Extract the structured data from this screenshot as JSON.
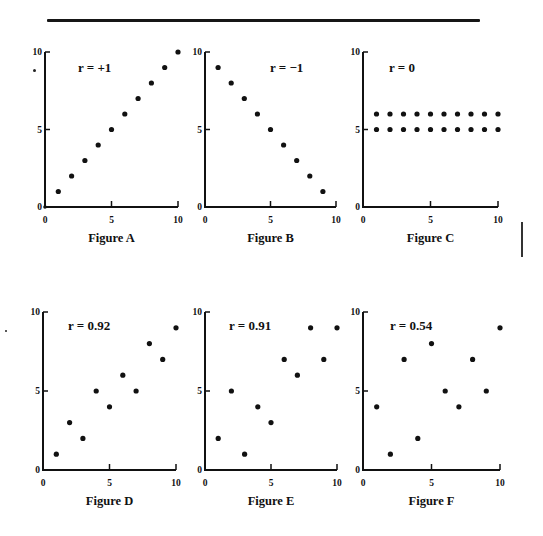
{
  "chart_data": [
    {
      "type": "scatter",
      "id": "A",
      "title": "Figure A",
      "annotation": "r = +1",
      "xlim": [
        0,
        10
      ],
      "ylim": [
        0,
        10
      ],
      "xticks": [
        0,
        5,
        10
      ],
      "yticks": [
        0,
        5,
        10
      ],
      "points": [
        [
          0,
          0
        ],
        [
          1,
          1
        ],
        [
          2,
          2
        ],
        [
          3,
          3
        ],
        [
          4,
          4
        ],
        [
          5,
          5
        ],
        [
          6,
          6
        ],
        [
          7,
          7
        ],
        [
          8,
          8
        ],
        [
          9,
          9
        ],
        [
          10,
          10
        ]
      ]
    },
    {
      "type": "scatter",
      "id": "B",
      "title": "Figure B",
      "annotation": "r = −1",
      "xlim": [
        0,
        10
      ],
      "ylim": [
        0,
        10
      ],
      "xticks": [
        0,
        5,
        10
      ],
      "yticks": [
        0,
        5,
        10
      ],
      "points": [
        [
          1,
          9
        ],
        [
          2,
          8
        ],
        [
          3,
          7
        ],
        [
          4,
          6
        ],
        [
          5,
          5
        ],
        [
          6,
          4
        ],
        [
          7,
          3
        ],
        [
          8,
          2
        ],
        [
          9,
          1
        ]
      ]
    },
    {
      "type": "scatter",
      "id": "C",
      "title": "Figure C",
      "annotation": "r = 0",
      "xlim": [
        0,
        10
      ],
      "ylim": [
        0,
        10
      ],
      "xticks": [
        0,
        5,
        10
      ],
      "yticks": [
        0,
        5,
        10
      ],
      "points": [
        [
          1,
          6
        ],
        [
          2,
          6
        ],
        [
          3,
          6
        ],
        [
          4,
          6
        ],
        [
          5,
          6
        ],
        [
          6,
          6
        ],
        [
          7,
          6
        ],
        [
          8,
          6
        ],
        [
          9,
          6
        ],
        [
          10,
          6
        ],
        [
          1,
          5
        ],
        [
          2,
          5
        ],
        [
          3,
          5
        ],
        [
          4,
          5
        ],
        [
          5,
          5
        ],
        [
          6,
          5
        ],
        [
          7,
          5
        ],
        [
          8,
          5
        ],
        [
          9,
          5
        ],
        [
          10,
          5
        ]
      ]
    },
    {
      "type": "scatter",
      "id": "D",
      "title": "Figure D",
      "annotation": "r = 0.92",
      "xlim": [
        0,
        10
      ],
      "ylim": [
        0,
        10
      ],
      "xticks": [
        0,
        5,
        10
      ],
      "yticks": [
        0,
        5,
        10
      ],
      "points": [
        [
          1,
          1
        ],
        [
          2,
          3
        ],
        [
          3,
          2
        ],
        [
          4,
          5
        ],
        [
          5,
          4
        ],
        [
          6,
          6
        ],
        [
          7,
          5
        ],
        [
          8,
          8
        ],
        [
          9,
          7
        ],
        [
          10,
          9
        ]
      ]
    },
    {
      "type": "scatter",
      "id": "E",
      "title": "Figure E",
      "annotation": "r = 0.91",
      "xlim": [
        0,
        10
      ],
      "ylim": [
        0,
        10
      ],
      "xticks": [
        0,
        5,
        10
      ],
      "yticks": [
        0,
        5,
        10
      ],
      "points": [
        [
          1,
          2
        ],
        [
          2,
          5
        ],
        [
          3,
          1
        ],
        [
          4,
          4
        ],
        [
          5,
          3
        ],
        [
          6,
          7
        ],
        [
          7,
          6
        ],
        [
          8,
          9
        ],
        [
          9,
          7
        ],
        [
          10,
          9
        ]
      ]
    },
    {
      "type": "scatter",
      "id": "F",
      "title": "Figure F",
      "annotation": "r = 0.54",
      "xlim": [
        0,
        10
      ],
      "ylim": [
        0,
        10
      ],
      "xticks": [
        0,
        5,
        10
      ],
      "yticks": [
        0,
        5,
        10
      ],
      "points": [
        [
          1,
          4
        ],
        [
          2,
          1
        ],
        [
          3,
          7
        ],
        [
          4,
          2
        ],
        [
          5,
          8
        ],
        [
          6,
          5
        ],
        [
          7,
          4
        ],
        [
          8,
          7
        ],
        [
          9,
          5
        ],
        [
          10,
          9
        ]
      ]
    }
  ],
  "layout": [
    {
      "x0": 45,
      "x10": 178,
      "y0": 207,
      "y10": 52,
      "rx": 78,
      "ry": 60,
      "cap_y": 231
    },
    {
      "x0": 205,
      "x10": 336,
      "y0": 207,
      "y10": 52,
      "rx": 270,
      "ry": 60,
      "cap_y": 231
    },
    {
      "x0": 363,
      "x10": 498,
      "y0": 207,
      "y10": 52,
      "rx": 389,
      "ry": 60,
      "cap_y": 231
    },
    {
      "x0": 43,
      "x10": 176,
      "y0": 470,
      "y10": 312,
      "rx": 68,
      "ry": 318,
      "cap_y": 494
    },
    {
      "x0": 205,
      "x10": 337,
      "y0": 470,
      "y10": 312,
      "rx": 229,
      "ry": 318,
      "cap_y": 494
    },
    {
      "x0": 363,
      "x10": 500,
      "y0": 470,
      "y10": 312,
      "rx": 390,
      "ry": 318,
      "cap_y": 494
    }
  ]
}
